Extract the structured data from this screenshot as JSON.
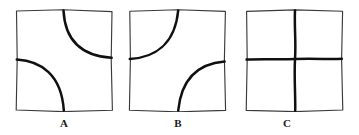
{
  "figure": {
    "width": 359,
    "height": 135,
    "background_color": "#ffffff",
    "frame_color": "#3a3a3a",
    "mark_color": "#101010",
    "label_color": "#1a1a1a"
  },
  "panels": [
    {
      "id": "panel-a",
      "label": "A",
      "label_x": 62,
      "label_y": 118,
      "box": {
        "x": 15,
        "y": 9,
        "w": 98,
        "h": 103
      },
      "frame_d": "M 1.5 2.0 L 48 0.8 L 97 2.6 L 96.2 50 L 97.4 101.2 L 48 102.6 L 1.2 101.0 L 2.2 50 Z",
      "marks": [
        {
          "name": "arc-upper-right",
          "shape": "quarter-arc",
          "d": "M 48.5 1.6 C 49.8 26.5 62.0 46.5 96.6 48.8",
          "description": "arc from top edge curving to right edge, concave toward bottom-right corner"
        },
        {
          "name": "arc-lower-left",
          "shape": "quarter-arc",
          "d": "M 1.8 50.5 C 26.0 52.0 46.5 65.5 48.8 101.4",
          "description": "arc from left edge curving to bottom edge, concave toward bottom-left corner"
        }
      ]
    },
    {
      "id": "panel-b",
      "label": "B",
      "label_x": 173,
      "label_y": 118,
      "box": {
        "x": 128,
        "y": 9,
        "w": 99,
        "h": 103
      },
      "frame_d": "M 1.8 2.2 L 50 0.7 L 97.4 2.4 L 96.4 50 L 97.6 101.4 L 50 102.8 L 1.4 101.2 L 2.4 50 Z",
      "marks": [
        {
          "name": "arc-upper-left",
          "shape": "quarter-arc",
          "d": "M 1.8 50.0 C 26.5 48.5 47.0 35.5 50.2 1.5",
          "description": "arc from left edge curving to top edge, concave toward top-right"
        },
        {
          "name": "arc-lower-right",
          "shape": "quarter-arc",
          "d": "M 50.2 101.6 C 53.5 68.0 72.0 54.5 96.6 52.5",
          "description": "arc from bottom edge curving to right edge, concave toward top-left"
        }
      ]
    },
    {
      "id": "panel-c",
      "label": "C",
      "label_x": 285,
      "label_y": 118,
      "box": {
        "x": 245,
        "y": 9,
        "w": 99,
        "h": 103
      },
      "frame_d": "M 1.6 2.4 L 50 0.9 L 97.6 2.2 L 96.6 50 L 97.8 101.0 L 50 102.6 L 1.2 101.4 L 2.2 50 Z",
      "marks": [
        {
          "name": "cross-vertical-line",
          "shape": "line",
          "d": "M 50.0 1.4 C 49.2 18 51.2 34 50.0 50 C 49.0 70 50.6 86 50.2 101.8",
          "description": "vertical line spanning full height through the centre"
        },
        {
          "name": "cross-horizontal-line",
          "shape": "line",
          "d": "M 1.6 50.6 C 18 49.6 34 50.8 50 50.0 C 70 49.2 86 50.6 96.8 49.8",
          "description": "horizontal line spanning full width through the centre"
        }
      ]
    }
  ]
}
